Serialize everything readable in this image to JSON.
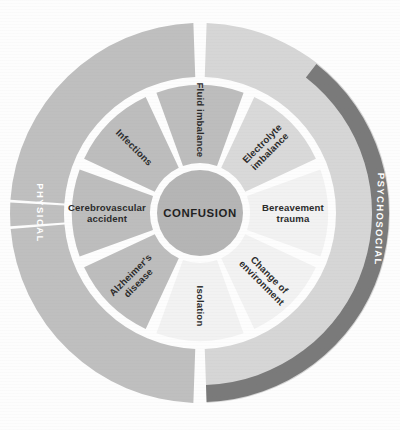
{
  "diagram": {
    "title": "CONFUSION",
    "hub": {
      "label": "CONFUSION",
      "fill": "#b5b5b5"
    },
    "rings": [
      {
        "name": "physical",
        "label": "PHYSICAL",
        "fill": "#bfbfbf",
        "label_fill": "#ffffff",
        "side": "left"
      },
      {
        "name": "psychosocial",
        "label": "PSYCHOSOCIAL",
        "fill": "#d6d6d6",
        "accent_fill": "#7a7a7a",
        "label_fill": "#ffffff",
        "side": "right"
      }
    ],
    "segments": [
      {
        "id": "fluid-imbalance",
        "label": "Fluid imbalance",
        "lines": [
          "Fluid imbalance"
        ],
        "category": "physical",
        "fill": "#bdbdbd",
        "start_angle": 247.5,
        "end_angle": 292.5
      },
      {
        "id": "infections",
        "label": "Infections",
        "lines": [
          "Infections"
        ],
        "category": "physical",
        "fill": "#bdbdbd",
        "start_angle": 202.5,
        "end_angle": 247.5
      },
      {
        "id": "cerebrovascular-accident",
        "label": "Cerebrovascular accident",
        "lines": [
          "Cerebrovascular",
          "accident"
        ],
        "category": "physical",
        "fill": "#bdbdbd",
        "start_angle": 157.5,
        "end_angle": 202.5
      },
      {
        "id": "alzheimers-disease",
        "label": "Alzheimer's disease",
        "lines": [
          "Alzheimer's",
          "disease"
        ],
        "category": "physical",
        "fill": "#bdbdbd",
        "start_angle": 112.5,
        "end_angle": 157.5
      },
      {
        "id": "isolation",
        "label": "Isolation",
        "lines": [
          "Isolation"
        ],
        "category": "psychosocial",
        "fill": "#f2f2f2",
        "start_angle": 67.5,
        "end_angle": 112.5
      },
      {
        "id": "change-of-environment",
        "label": "Change of environment",
        "lines": [
          "Change of",
          "environment"
        ],
        "category": "psychosocial",
        "fill": "#f2f2f2",
        "start_angle": 22.5,
        "end_angle": 67.5
      },
      {
        "id": "bereavement-trauma",
        "label": "Bereavement trauma",
        "lines": [
          "Bereavement",
          "trauma"
        ],
        "category": "psychosocial",
        "fill": "#f2f2f2",
        "start_angle": -22.5,
        "end_angle": 22.5
      },
      {
        "id": "electrolyte-imbalance",
        "label": "Electrolyte imbalance",
        "lines": [
          "Electrolyte",
          "imbalance"
        ],
        "category": "psychosocial",
        "fill": "#d9d9d9",
        "start_angle": -67.5,
        "end_angle": -22.5
      }
    ],
    "colors": {
      "background": "#fdfdfd",
      "gap": "#ffffff",
      "outer_physical": "#bfbfbf",
      "outer_psychosocial": "#d6d6d6",
      "outer_psychosocial_accent": "#7a7a7a",
      "inner_physical": "#bdbdbd",
      "inner_psychosocial": "#f2f2f2",
      "hub": "#b5b5b5",
      "text_dark": "#2b2b2b",
      "text_light": "#ffffff"
    }
  }
}
